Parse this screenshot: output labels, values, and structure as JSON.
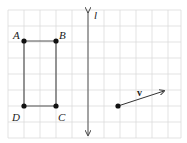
{
  "diagram": {
    "grid": {
      "x0": 7,
      "y0": 10,
      "cell": 16,
      "cols": 11,
      "rows": 8,
      "color": "#dcdcdc"
    },
    "rectangle": {
      "color": "#444444",
      "points": {
        "A": {
          "label": "A",
          "x": 24,
          "y": 41
        },
        "B": {
          "label": "B",
          "x": 56,
          "y": 41
        },
        "C": {
          "label": "C",
          "x": 56,
          "y": 106
        },
        "D": {
          "label": "D",
          "x": 24,
          "y": 106
        }
      }
    },
    "line_l": {
      "label": "l",
      "x": 88,
      "y1": 8,
      "y2": 138,
      "color": "#555555"
    },
    "vector_v": {
      "label": "v",
      "x1": 118,
      "y1": 106,
      "x2": 164,
      "y2": 91,
      "color": "#333333"
    }
  }
}
